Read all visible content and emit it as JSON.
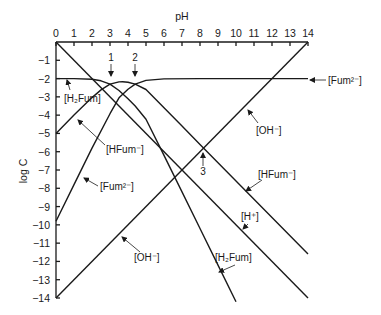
{
  "chart_data": {
    "type": "line",
    "title": "",
    "xlabel": "pH",
    "ylabel": "log C",
    "xlim": [
      0,
      14
    ],
    "ylim": [
      -14,
      0
    ],
    "x_ticks": [
      "0",
      "1",
      "2",
      "3",
      "4",
      "5",
      "6",
      "7",
      "8",
      "9",
      "10",
      "11",
      "12",
      "13",
      "14"
    ],
    "y_ticks": [
      "-1",
      "-2",
      "-3",
      "-4",
      "-5",
      "-6",
      "-7",
      "-8",
      "-9",
      "-10",
      "-11",
      "-12",
      "-13",
      "-14"
    ],
    "grid": false,
    "total_concentration_logC": -2,
    "pKa1": 3.0,
    "pKa2": 4.4,
    "series": [
      {
        "name": "[H+]",
        "x": [
          0,
          14
        ],
        "y": [
          0,
          -14
        ]
      },
      {
        "name": "[OH-]",
        "x": [
          0,
          14
        ],
        "y": [
          -14,
          0
        ]
      },
      {
        "name": "[H2Fum]",
        "x": [
          0,
          1,
          2,
          2.5,
          3,
          3.5,
          4,
          4.4,
          5,
          6,
          7,
          8,
          9,
          10
        ],
        "y": [
          -2,
          -2.0,
          -2.04,
          -2.12,
          -2.3,
          -2.65,
          -3.1,
          -3.5,
          -4.22,
          -6.2,
          -8.2,
          -10.2,
          -12.2,
          -14.2
        ]
      },
      {
        "name": "[HFum-]",
        "x": [
          0,
          1,
          2,
          2.5,
          3,
          3.5,
          3.7,
          4,
          4.4,
          5,
          6,
          7,
          8,
          10,
          12,
          14
        ],
        "y": [
          -5,
          -4,
          -3.04,
          -2.62,
          -2.3,
          -2.18,
          -2.17,
          -2.2,
          -2.3,
          -2.6,
          -3.6,
          -4.6,
          -5.6,
          -7.6,
          -9.6,
          -11.6
        ]
      },
      {
        "name": "[Fum2-]",
        "x": [
          0,
          1,
          2,
          3,
          3.5,
          4,
          4.4,
          5,
          6,
          8,
          10,
          12,
          14
        ],
        "y": [
          -9.8,
          -7.8,
          -5.8,
          -3.92,
          -3.05,
          -2.58,
          -2.3,
          -2.1,
          -2.02,
          -2.0,
          -2.0,
          -2.0,
          -2.0
        ]
      }
    ],
    "annotations": [
      {
        "text": "1",
        "x": 3.0,
        "y": -2.3,
        "note": "pH = pKa1"
      },
      {
        "text": "2",
        "x": 4.4,
        "y": -2.3,
        "note": "pH = pKa2"
      },
      {
        "text": "3",
        "x": 8.1,
        "y": -5.9,
        "note": "[OH-] = [HFum-]"
      }
    ]
  },
  "labels": {
    "xlabel": "pH",
    "ylabel": "log C",
    "h2fum_top": "[H₂Fum]",
    "hfum_left": "[HFum⁻]",
    "fum_left": "[Fum²⁻]",
    "oh_left": "[OH⁻]",
    "fum_right": "[Fum²⁻]",
    "oh_right": "[OH⁻]",
    "hfum_right": "[HFum⁻]",
    "h_right": "[H⁺]",
    "h2fum_bottom": "[H₂Fum]",
    "point1": "1",
    "point2": "2",
    "point3": "3"
  }
}
